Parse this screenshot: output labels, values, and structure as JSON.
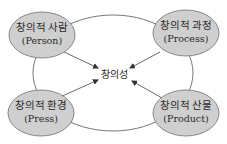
{
  "diagram": {
    "center": {
      "label": "창의성"
    },
    "nodes": [
      {
        "id": "person",
        "korean": "창의적 사람",
        "english": "(Person)"
      },
      {
        "id": "process",
        "korean": "창의적 과정",
        "english": "(Process)"
      },
      {
        "id": "press",
        "korean": "창의적 환경",
        "english": "(Press)"
      },
      {
        "id": "product",
        "korean": "창의적 산물",
        "english": "(Product)"
      }
    ],
    "colors": {
      "node_fill": "#cfcfcf",
      "node_stroke": "#6f6f6f",
      "line": "#555555",
      "text": "#2a2a2a"
    }
  }
}
